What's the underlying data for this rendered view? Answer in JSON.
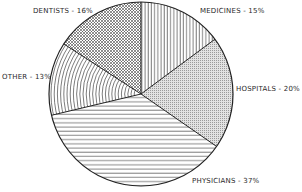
{
  "chart_data": {
    "type": "pie",
    "title": "",
    "categories": [
      "Medicines",
      "Hospitals",
      "Physicians",
      "Other",
      "Dentists"
    ],
    "values": [
      15,
      20,
      37,
      13,
      16
    ],
    "unit": "%",
    "start_angle_deg": 0,
    "direction": "clockwise",
    "slices": [
      {
        "name": "Medicines",
        "value": 15,
        "label": "MEDICINES - 15%",
        "pattern": "vertical-lines"
      },
      {
        "name": "Hospitals",
        "value": 20,
        "label": "HOSPITALS - 20%",
        "pattern": "fine-dots"
      },
      {
        "name": "Physicians",
        "value": 37,
        "label": "PHYSICIANS - 37%",
        "pattern": "horizontal-lines"
      },
      {
        "name": "Other",
        "value": 13,
        "label": "OTHER - 13%",
        "pattern": "concentric-arcs"
      },
      {
        "name": "Dentists",
        "value": 16,
        "label": "DENTISTS - 16%",
        "pattern": "crosshatch"
      }
    ],
    "legend": "none (labels placed beside slices)"
  },
  "labels": {
    "dentists": "DENTISTS - 16%",
    "medicines": "MEDICINES - 15%",
    "other": "OTHER - 13%",
    "hospitals": "HOSPITALS - 20%",
    "physicians": "PHYSICIANS - 37%"
  },
  "colors": {
    "ink": "#2a2a2a",
    "background": "#ffffff"
  }
}
